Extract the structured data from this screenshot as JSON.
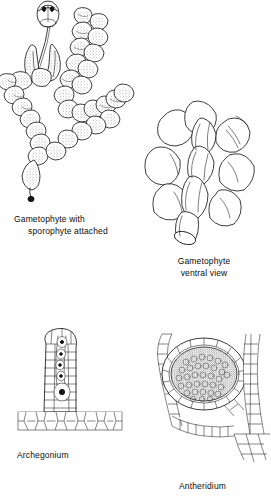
{
  "plate": {
    "title": "Bryophyte life-cycle structures plate",
    "background_color": "#fefefe",
    "ink_color": "#1a1a1a",
    "figure_count": 4
  },
  "figures": [
    {
      "id": "gametophyte-with-sporophyte",
      "caption_line1": "Gametophyte with",
      "caption_line2": "sporophyte attached",
      "subject": "leafy gametophyte shoot bearing an attached sporophyte capsule on a seta",
      "style": "stippled pen-and-ink line drawing"
    },
    {
      "id": "gametophyte-ventral-view",
      "caption_line1": "Gametophyte",
      "caption_line2": "ventral view",
      "subject": "leafy gametophyte seen from the ventral side showing overlapping leaves",
      "style": "outline pen-and-ink line drawing"
    },
    {
      "id": "archegonium",
      "caption_line1": "Archegonium",
      "caption_line2": "",
      "subject": "longitudinal section of an archegonium with neck canal cells, venter and egg, seated on thallus tissue",
      "style": "cellular line drawing"
    },
    {
      "id": "antheridium",
      "caption_line1": "Antheridium",
      "caption_line2": "",
      "subject": "antheridium with jacket layer enclosing spermatogenous cell mass, paraphysis filament at left and stem tissue at right",
      "style": "cellular line drawing"
    }
  ]
}
